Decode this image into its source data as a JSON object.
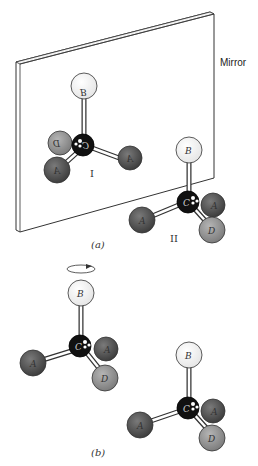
{
  "figure": {
    "mirror_label": "Mirror",
    "panel_a_caption": "(a)",
    "panel_b_caption": "(b)",
    "molecule_I_label": "I",
    "molecule_II_label": "II"
  },
  "atoms": {
    "carbon": "C",
    "B": "B",
    "A": "A",
    "D": "D"
  },
  "mirror_text": {
    "B": "B",
    "A": "A",
    "D": "D"
  },
  "colors": {
    "A_atom": "#5a5a5a",
    "D_atom": "#9a9a9a",
    "B_atom": "#ffffff",
    "C_atom": "#111111",
    "mirror_outline": "#333333"
  }
}
